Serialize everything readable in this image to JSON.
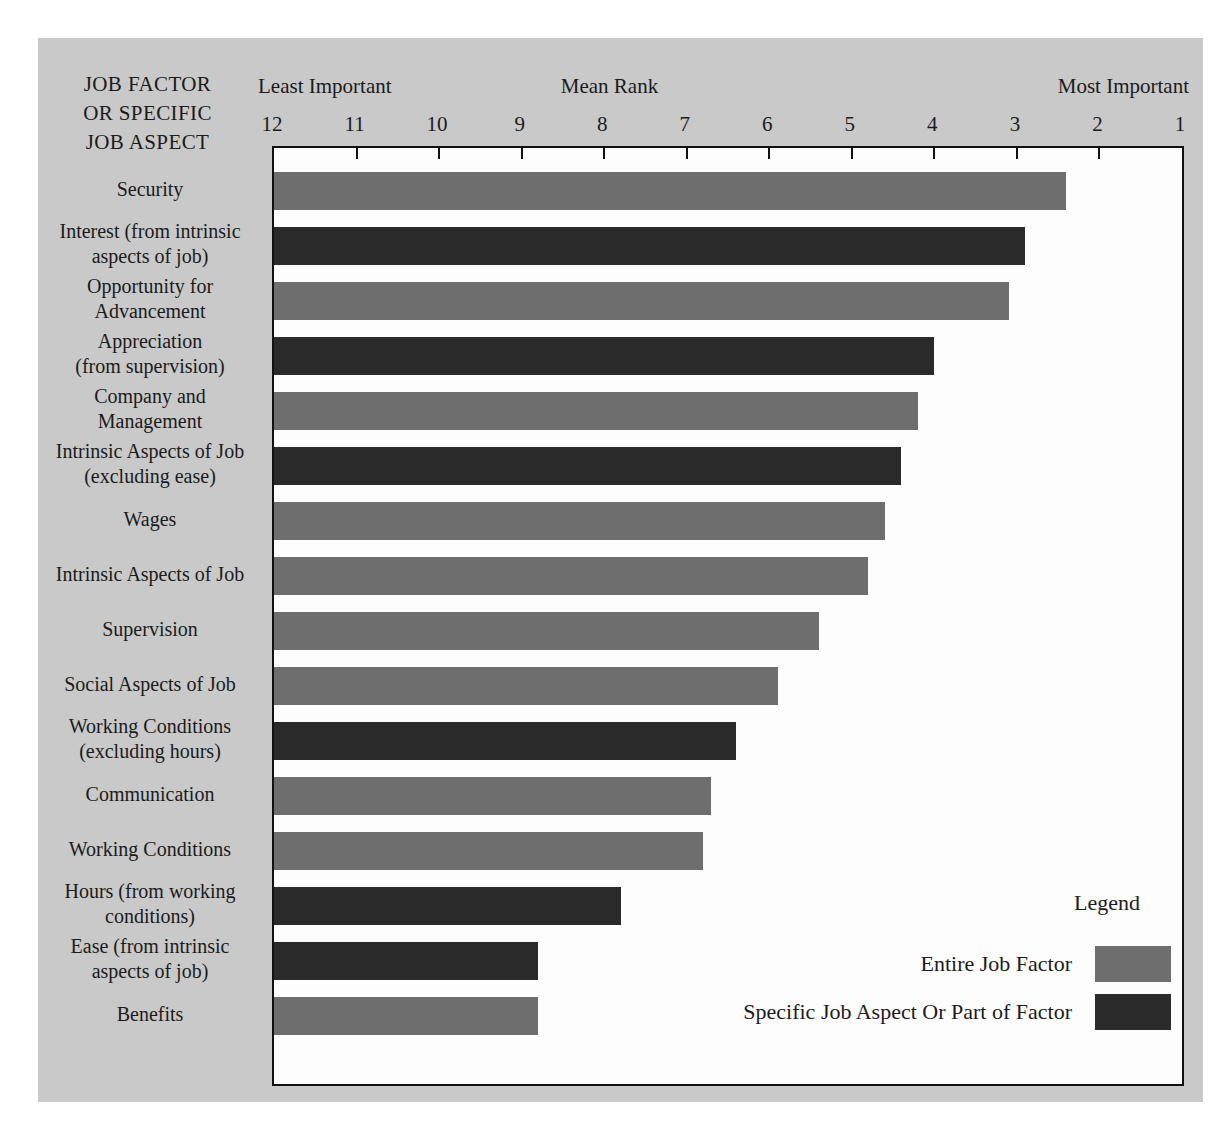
{
  "figure": {
    "row_header_lines": [
      "JOB FACTOR",
      "OR SPECIFIC",
      "JOB ASPECT"
    ],
    "least_important_label": "Least Important",
    "most_important_label": "Most Important",
    "axis_title": "Mean Rank"
  },
  "legend": {
    "title": "Legend",
    "entries": [
      {
        "label": "Entire Job Factor",
        "series": "factor",
        "color": "#6e6e6e"
      },
      {
        "label": "Specific Job Aspect Or Part of Factor",
        "series": "aspect",
        "color": "#2a2a2a"
      }
    ]
  },
  "colors": {
    "panel_background": "#c9c9c9",
    "plot_background": "#fdfdfd",
    "axis": "#111111",
    "factor_bar": "#6e6e6e",
    "aspect_bar": "#2a2a2a",
    "text": "#1b1b1b"
  },
  "chart_data": {
    "type": "bar",
    "orientation": "horizontal",
    "xlabel": "Mean Rank",
    "ylabel": "JOB FACTOR OR SPECIFIC JOB ASPECT",
    "xlim": [
      12,
      1
    ],
    "x_axis_reversed": true,
    "xticks": [
      12,
      11,
      10,
      9,
      8,
      7,
      6,
      5,
      4,
      3,
      2,
      1
    ],
    "xtick_labels": [
      "12",
      "11",
      "10",
      "9",
      "8",
      "7",
      "6",
      "5",
      "4",
      "3",
      "2",
      "1"
    ],
    "x_end_annotations": {
      "left": "Least Important",
      "right": "Most Important"
    },
    "grid": false,
    "legend_position": "bottom-right",
    "categories": [
      "Security",
      "Interest (from intrinsic aspects of job)",
      "Opportunity for Advancement",
      "Appreciation (from supervision)",
      "Company and Management",
      "Intrinsic Aspects of Job (excluding ease)",
      "Wages",
      "Intrinsic Aspects of Job",
      "Supervision",
      "Social Aspects of Job",
      "Working Conditions (excluding hours)",
      "Communication",
      "Working Conditions",
      "Hours (from working conditions)",
      "Ease (from intrinsic aspects of job)",
      "Benefits"
    ],
    "values": [
      2.4,
      2.9,
      3.1,
      4.0,
      4.2,
      4.4,
      4.6,
      4.8,
      5.4,
      5.9,
      6.4,
      6.7,
      6.8,
      7.8,
      8.8,
      8.8
    ],
    "series_of": [
      "factor",
      "aspect",
      "factor",
      "aspect",
      "factor",
      "aspect",
      "factor",
      "factor",
      "factor",
      "factor",
      "aspect",
      "factor",
      "factor",
      "aspect",
      "aspect",
      "factor"
    ],
    "series": [
      {
        "name": "Entire Job Factor",
        "key": "factor",
        "color": "#6e6e6e"
      },
      {
        "name": "Specific Job Aspect Or Part of Factor",
        "key": "aspect",
        "color": "#2a2a2a"
      }
    ]
  },
  "bar_label_lines": [
    [
      "Security"
    ],
    [
      "Interest (from intrinsic",
      "aspects of job)"
    ],
    [
      "Opportunity for",
      "Advancement"
    ],
    [
      "Appreciation",
      "(from supervision)"
    ],
    [
      "Company and",
      "Management"
    ],
    [
      "Intrinsic Aspects of Job",
      "(excluding ease)"
    ],
    [
      "Wages"
    ],
    [
      "Intrinsic Aspects of Job"
    ],
    [
      "Supervision"
    ],
    [
      "Social Aspects of Job"
    ],
    [
      "Working Conditions",
      "(excluding hours)"
    ],
    [
      "Communication"
    ],
    [
      "Working Conditions"
    ],
    [
      "Hours (from working",
      "conditions)"
    ],
    [
      "Ease (from intrinsic",
      "aspects of job)"
    ],
    [
      "Benefits"
    ]
  ]
}
